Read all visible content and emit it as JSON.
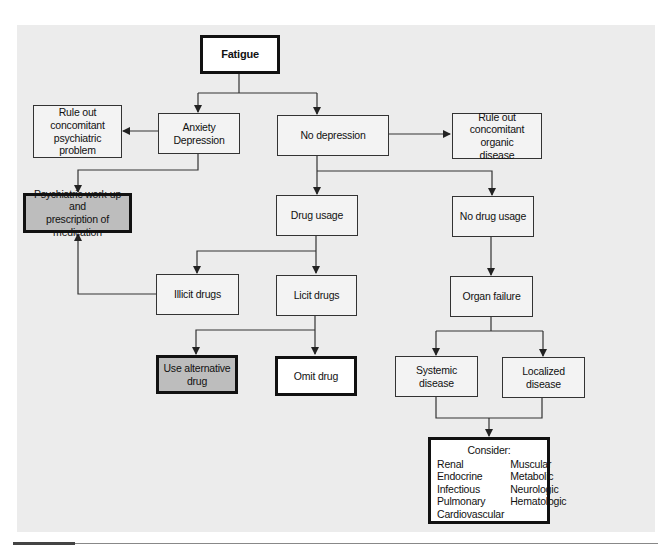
{
  "diagram": {
    "title": "Fatigue",
    "nodes": {
      "fatigue": "Fatigue",
      "anxiety_depression": "Anxiety\nDepression",
      "no_depression": "No depression",
      "rule_out_psychiatric": "Rule out\nconcomitant\npsychiatric problem",
      "rule_out_organic": "Rule out\nconcomitant organic\ndisease",
      "psychiatric_workup": "Psychiatric work-up and\nprescription of medication",
      "drug_usage": "Drug usage",
      "no_drug_usage": "No drug usage",
      "illicit_drugs": "Illicit drugs",
      "licit_drugs": "Licit drugs",
      "organ_failure": "Organ failure",
      "use_alternative_drug": "Use alternative\ndrug",
      "omit_drug": "Omit drug",
      "systemic_disease": "Systemic disease",
      "localized_disease": "Localized disease",
      "consider": {
        "title": "Consider:",
        "items": [
          "Renal",
          "Muscular",
          "Endocrine",
          "Metabolic",
          "Infectious",
          "Neurologic",
          "Pulmonary",
          "Hematologic",
          "Cardiovascular"
        ]
      }
    },
    "edges": [
      [
        "Fatigue",
        "Anxiety Depression"
      ],
      [
        "Fatigue",
        "No depression"
      ],
      [
        "Anxiety Depression",
        "Rule out concomitant psychiatric problem"
      ],
      [
        "Anxiety Depression",
        "Psychiatric work-up and prescription of medication"
      ],
      [
        "No depression",
        "Rule out concomitant organic disease"
      ],
      [
        "No depression",
        "Drug usage"
      ],
      [
        "No depression",
        "No drug usage"
      ],
      [
        "Drug usage",
        "Illicit drugs"
      ],
      [
        "Drug usage",
        "Licit drugs"
      ],
      [
        "Illicit drugs",
        "Psychiatric work-up and prescription of medication"
      ],
      [
        "Licit drugs",
        "Use alternative drug"
      ],
      [
        "Licit drugs",
        "Omit drug"
      ],
      [
        "No drug usage",
        "Organ failure"
      ],
      [
        "Organ failure",
        "Systemic disease"
      ],
      [
        "Organ failure",
        "Localized disease"
      ],
      [
        "Systemic disease",
        "Consider"
      ],
      [
        "Localized disease",
        "Consider"
      ]
    ],
    "colors": {
      "panel": "#ececec",
      "highlight_box": "#bdbdbd",
      "line": "#333333"
    }
  }
}
